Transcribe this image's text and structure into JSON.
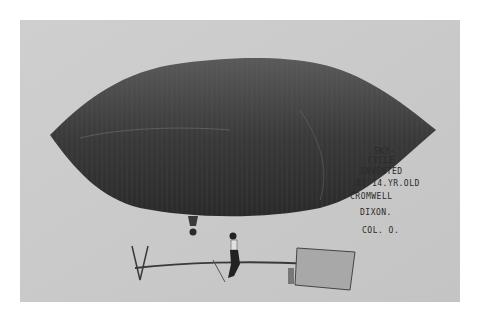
{
  "photo": {
    "subject": "sky-cycle airship",
    "background_color": "#c9c9c9",
    "balloon_color": "#3a3a3a"
  },
  "caption": {
    "lines": [
      "SKY-",
      "CYCLE",
      "INVENTED",
      "BY 14.YR.OLD",
      "CROMWELL",
      "DIXON.",
      "COL. O."
    ]
  }
}
